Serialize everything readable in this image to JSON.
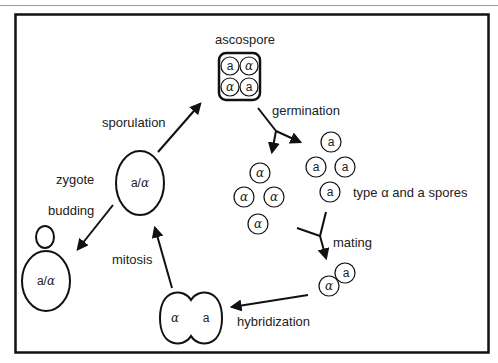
{
  "diagram": {
    "colors": {
      "stroke": "#111111",
      "text": "#222222",
      "background": "#ffffff",
      "header_rule": "#9a9a9a"
    },
    "labels": {
      "ascospore": "ascospore",
      "germination": "germination",
      "sporulation": "sporulation",
      "zygote": "zygote",
      "budding": "budding",
      "spores_type": "type α and a spores",
      "mating": "mating",
      "mitosis": "mitosis",
      "hybridization": "hybridization"
    },
    "ascospore_contents": [
      "a",
      "α",
      "α",
      "a"
    ],
    "alpha_spores": [
      "α",
      "α",
      "α",
      "α"
    ],
    "a_spores": [
      "a",
      "a",
      "a",
      "a"
    ],
    "zygote_genotype": "a/α",
    "budding_genotype": "a/α",
    "mating_pair": [
      "α",
      "a"
    ],
    "hybrid_cell": [
      "α",
      "a"
    ]
  }
}
